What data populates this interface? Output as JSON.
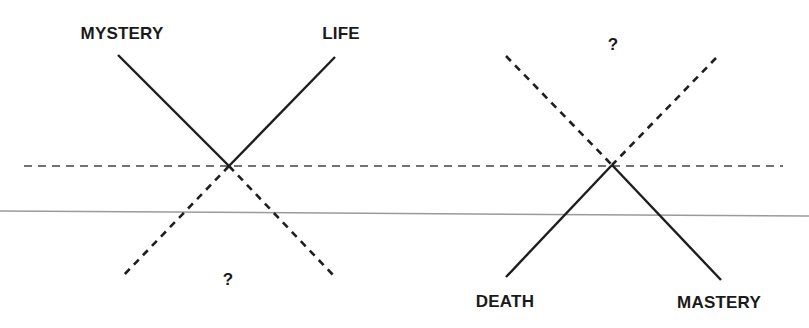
{
  "diagram": {
    "colors": {
      "ink": "#1e1e1e",
      "rule": "#9a9a9a",
      "background": "#ffffff"
    },
    "labels": {
      "top_left": "MYSTERY",
      "top_right": "LIFE",
      "bottom_left_unknown": "?",
      "top_right_unknown": "?",
      "bottom_right_left": "DEATH",
      "bottom_right_right": "MASTERY"
    },
    "left_cross": {
      "center": [
        229,
        166
      ],
      "solid_upper": [
        [
          118,
          55
        ],
        [
          335,
          57
        ]
      ],
      "dashed_lower": [
        [
          122,
          277
        ],
        [
          335,
          277
        ]
      ]
    },
    "right_cross": {
      "center": [
        612,
        165
      ],
      "dashed_upper": [
        [
          506,
          56
        ],
        [
          716,
          58
        ]
      ],
      "solid_lower": [
        [
          506,
          277
        ],
        [
          721,
          280
        ]
      ]
    },
    "horizontal_dashed_line": {
      "x1": 24,
      "y1": 166,
      "x2": 783,
      "y2": 166
    },
    "baseline_rule": {
      "x1": 0,
      "y1": 211,
      "x2": 809,
      "y2": 216
    }
  }
}
